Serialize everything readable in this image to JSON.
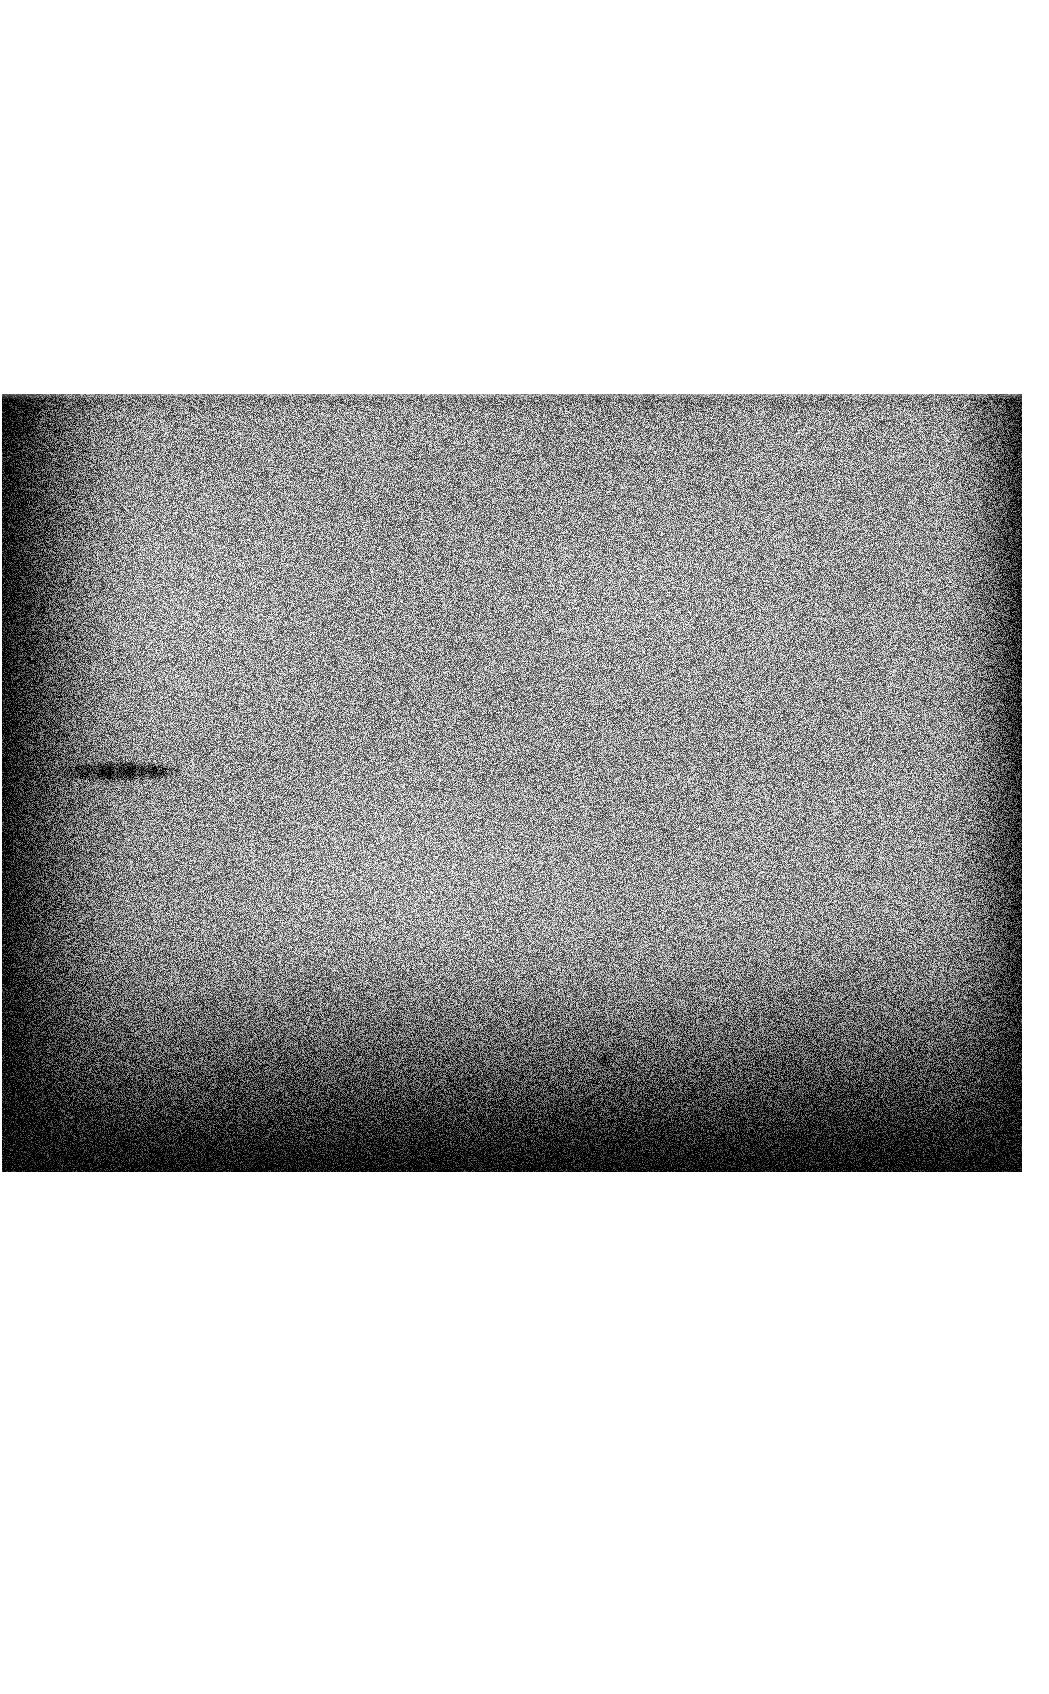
{
  "document": {
    "kind": "autoradiograph-film-scan",
    "background_color": "#ffffff",
    "width": 1049,
    "height": 1694,
    "caption": "",
    "title": ""
  },
  "film": {
    "label": "film-exposure",
    "x": 2,
    "y": 394,
    "width": 1020,
    "height": 778,
    "base_gray": "#8e8e8e",
    "highlight_gray": "#c9c9c9",
    "shadow_gray": "#1a1a1a",
    "grain_strength": 78,
    "grain_scale": 1,
    "vignette": {
      "top_edge_darkness": 0.18,
      "bottom_edge_darkness": 0.96,
      "left_edge_darkness": 0.88,
      "right_edge_darkness": 0.72,
      "center_x_ratio": 0.46,
      "center_y_ratio": 0.32
    }
  },
  "features": {
    "bands": [
      {
        "name": "protein-band",
        "lane": 1,
        "x": 58,
        "y": 763,
        "width": 118,
        "height": 16,
        "intensity": "strong",
        "color": "#0d0d0d"
      }
    ],
    "specks": [
      {
        "name": "dust-speck",
        "x": 604,
        "y": 1059,
        "radius": 5,
        "color": "#101010"
      },
      {
        "name": "corner-smudge",
        "x": 6,
        "y": 404,
        "radius": 26,
        "color": "#141414"
      },
      {
        "name": "edge-artifact",
        "x": 3,
        "y": 838,
        "radius": 9,
        "color": "#0f0f0f"
      }
    ],
    "streaks": [
      {
        "name": "bottom-streak",
        "x": 520,
        "y": 1070,
        "width": 160,
        "height": 96,
        "color": "#0a0a0a",
        "opacity": 0.45
      }
    ]
  },
  "margins": {
    "top_label": "top-margin",
    "bottom_label": "bottom-margin",
    "left_label": "left-margin",
    "right_label": "right-margin",
    "top_height": 394,
    "bottom_height": 522,
    "left_width": 2,
    "right_width": 27
  }
}
